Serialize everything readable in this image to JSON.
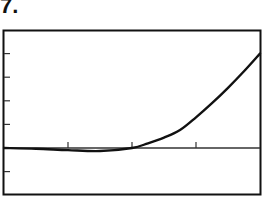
{
  "problem_label": "7.",
  "chart_data": {
    "type": "line",
    "title": "",
    "xlabel": "",
    "ylabel": "",
    "xlim": [
      0,
      4
    ],
    "ylim": [
      -2,
      5
    ],
    "x_ticks": [
      1,
      2,
      3
    ],
    "y_ticks": [
      -1,
      1,
      2,
      3,
      4
    ],
    "grid": false,
    "legend": null,
    "series": [
      {
        "name": "f(x)",
        "x": [
          0,
          0.5,
          1,
          1.5,
          2,
          2.25,
          2.5,
          2.75,
          3,
          3.25,
          3.5,
          3.75,
          4
        ],
        "y": [
          0,
          -0.03,
          -0.09,
          -0.13,
          0,
          0.2,
          0.44,
          0.76,
          1.3,
          1.9,
          2.55,
          3.25,
          4.0
        ]
      }
    ]
  },
  "frame": {
    "color": "#111111",
    "background": "#ffffff"
  }
}
